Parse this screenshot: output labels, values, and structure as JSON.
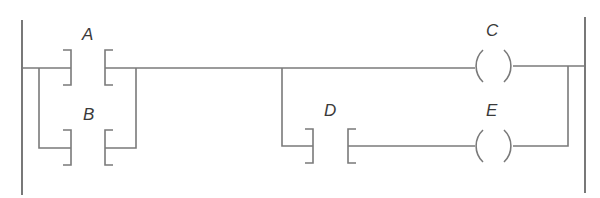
{
  "diagram": {
    "type": "ladder-logic",
    "colors": {
      "line": "#7a7a7a",
      "rail": "#6a6a6a",
      "text": "#3a3a3a",
      "background": "#ffffff"
    },
    "contacts": [
      {
        "id": "A",
        "label": "A",
        "type": "normally-open",
        "rung": 1
      },
      {
        "id": "B",
        "label": "B",
        "type": "normally-open",
        "rung": 1,
        "parallel_with": "A"
      },
      {
        "id": "D",
        "label": "D",
        "type": "normally-open",
        "rung": 2
      }
    ],
    "coils": [
      {
        "id": "C",
        "label": "C",
        "rung": 1
      },
      {
        "id": "E",
        "label": "E",
        "rung": 2,
        "in_series_with": "D"
      }
    ],
    "labels": {
      "A": "A",
      "B": "B",
      "C": "C",
      "D": "D",
      "E": "E"
    }
  }
}
